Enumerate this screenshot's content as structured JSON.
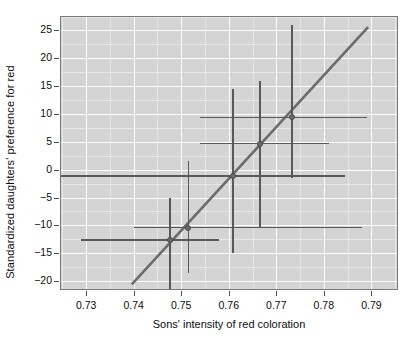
{
  "chart_data": {
    "type": "scatter",
    "title": "",
    "xlabel": "Sons' intensity of red coloration",
    "ylabel": "Standardized daughters' preference for red",
    "xlim": [
      0.7245,
      0.7956
    ],
    "ylim": [
      -21.6,
      27.6
    ],
    "xticks": [
      0.73,
      0.74,
      0.75,
      0.76,
      0.77,
      0.78,
      0.79
    ],
    "xticklabels": [
      "0.73",
      "0.74",
      "0.75",
      "0.76",
      "0.77",
      "0.78",
      "0.79"
    ],
    "yticks": [
      -20,
      -15,
      -10,
      -5,
      0,
      5,
      10,
      15,
      20,
      25
    ],
    "yticklabels": [
      "−20",
      "−15",
      "−10",
      "−5",
      "0",
      "5",
      "10",
      "15",
      "20",
      "25"
    ],
    "grid": true,
    "grid_color": "#ffffff",
    "minor_grid_color": "#e6e6e6",
    "panel_color": "#d4d4d4",
    "point_color": "#6b6b6b",
    "error_color": "#595959",
    "line_color": "#6b6b6b",
    "legend": "none",
    "points": [
      {
        "x": 0.7477,
        "y": -12.6,
        "xlo": 0.729,
        "xhi": 0.758,
        "ylo": -24.0,
        "yhi": -5.0
      },
      {
        "x": 0.7515,
        "y": -10.4,
        "xlo": 0.74,
        "xhi": 0.788,
        "ylo": -18.5,
        "yhi": 1.5
      },
      {
        "x": 0.7609,
        "y": -1.1,
        "xlo": 0.7245,
        "xhi": 0.7845,
        "ylo": -15.0,
        "yhi": 14.5
      },
      {
        "x": 0.7666,
        "y": 4.7,
        "xlo": 0.754,
        "xhi": 0.781,
        "ylo": -10.5,
        "yhi": 16.0
      },
      {
        "x": 0.7733,
        "y": 9.4,
        "xlo": 0.754,
        "xhi": 0.789,
        "ylo": -1.5,
        "yhi": 26.0
      }
    ],
    "fit_line": {
      "x1": 0.7396,
      "y1": -20.6,
      "x2": 0.7893,
      "y2": 25.6
    }
  }
}
